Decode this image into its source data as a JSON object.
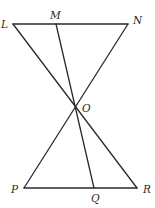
{
  "diagram": {
    "type": "geometry",
    "points": {
      "L": {
        "label": "L",
        "x": 13,
        "y": 24,
        "lx": 1,
        "ly": 28
      },
      "M": {
        "label": "M",
        "x": 56,
        "y": 24,
        "lx": 50,
        "ly": 19
      },
      "N": {
        "label": "N",
        "x": 128,
        "y": 24,
        "lx": 133,
        "ly": 24
      },
      "O": {
        "label": "O",
        "x": 75,
        "y": 106,
        "lx": 82,
        "ly": 112
      },
      "P": {
        "label": "P",
        "x": 24,
        "y": 188,
        "lx": 11,
        "ly": 193
      },
      "Q": {
        "label": "Q",
        "x": 94,
        "y": 188,
        "lx": 91,
        "ly": 202
      },
      "R": {
        "label": "R",
        "x": 137,
        "y": 188,
        "lx": 143,
        "ly": 193
      }
    },
    "segments": [
      {
        "from": "L",
        "to": "N",
        "name": "segment-ln"
      },
      {
        "from": "P",
        "to": "R",
        "name": "segment-pr"
      },
      {
        "from": "L",
        "to": "R",
        "name": "segment-lr"
      },
      {
        "from": "N",
        "to": "P",
        "name": "segment-np"
      },
      {
        "from": "M",
        "to": "Q",
        "name": "segment-mq"
      }
    ],
    "stroke_color": "#2a2a2a",
    "background": "#ffffff"
  }
}
